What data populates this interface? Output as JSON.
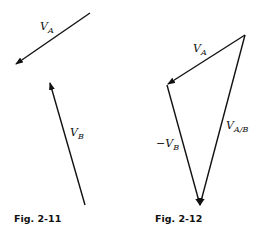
{
  "figures": [
    {
      "caption": "Fig. 2-11",
      "vectors": [
        {
          "name": "V",
          "sub": "A",
          "from": [
            90,
            13
          ],
          "to": [
            15,
            65
          ]
        },
        {
          "name": "V",
          "sub": "B",
          "from": [
            85,
            205
          ],
          "to": [
            50,
            82
          ]
        }
      ]
    },
    {
      "caption": "Fig. 2-12",
      "vectors": [
        {
          "name": "V",
          "sub": "A",
          "from": [
            245,
            35
          ],
          "to": [
            167,
            85
          ]
        },
        {
          "name": "−V",
          "sub": "B",
          "from": [
            167,
            85
          ],
          "to": [
            200,
            206
          ]
        },
        {
          "name": "V",
          "sub": "A/B",
          "from": [
            245,
            35
          ],
          "to": [
            200,
            206
          ]
        }
      ]
    }
  ],
  "colors": {
    "line": "#111111",
    "background": "#ffffff"
  }
}
